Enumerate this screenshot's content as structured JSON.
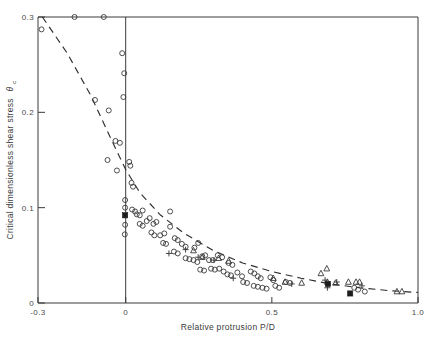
{
  "chart_data": {
    "type": "scatter",
    "title": "",
    "xlabel": "Relative protrusion P/D",
    "ylabel": "Critical dimensionless shear stress θc",
    "ylabel_main": "Critical dimensionless shear stress",
    "ylabel_symbol": "θ",
    "ylabel_subscript": "c",
    "xlim": [
      -0.3,
      1.0
    ],
    "ylim": [
      0.0,
      0.3
    ],
    "xticks": [
      -0.3,
      0,
      0.5,
      1.0
    ],
    "xticklabels": [
      "-0.3",
      "0",
      "0.5",
      "1.0"
    ],
    "yticks": [
      0,
      0.1,
      0.2,
      0.3
    ],
    "yticklabels": [
      "0",
      "0.1",
      "0.2",
      "0.3"
    ],
    "grid": false,
    "legend": "none",
    "marker_colors": {
      "open_circle": "#3a3a3a",
      "open_triangle": "#3a3a3a",
      "filled_square": "#1d1d1d",
      "plus": "#3a3a3a",
      "trendline": "#2e2e2e",
      "axis": "#3b3b3b"
    },
    "annotations": [
      {
        "name": "vertical-reference-line",
        "x": 0.0,
        "note": "vertical line at P/D = 0"
      },
      {
        "name": "dashed-trend-curve",
        "note": "dashed decreasing trend from upper-left to lower-right"
      }
    ],
    "trendline": {
      "style": "dashed",
      "points": [
        [
          -0.285,
          0.3
        ],
        [
          -0.2,
          0.262
        ],
        [
          -0.12,
          0.218
        ],
        [
          -0.05,
          0.172
        ],
        [
          0.0,
          0.14
        ],
        [
          0.05,
          0.115
        ],
        [
          0.12,
          0.092
        ],
        [
          0.2,
          0.073
        ],
        [
          0.3,
          0.055
        ],
        [
          0.4,
          0.042
        ],
        [
          0.5,
          0.033
        ],
        [
          0.6,
          0.026
        ],
        [
          0.7,
          0.02
        ],
        [
          0.8,
          0.016
        ],
        [
          0.9,
          0.013
        ],
        [
          1.0,
          0.011
        ]
      ]
    },
    "series": [
      {
        "name": "Open circles",
        "marker": "open_circle",
        "points": [
          [
            -0.288,
            0.287
          ],
          [
            -0.175,
            0.3
          ],
          [
            -0.075,
            0.3
          ],
          [
            -0.105,
            0.213
          ],
          [
            -0.058,
            0.202
          ],
          [
            -0.035,
            0.17
          ],
          [
            -0.062,
            0.15
          ],
          [
            -0.03,
            0.139
          ],
          [
            -0.012,
            0.262
          ],
          [
            -0.005,
            0.241
          ],
          [
            -0.008,
            0.216
          ],
          [
            -0.02,
            0.168
          ],
          [
            0.012,
            0.148
          ],
          [
            0.016,
            0.144
          ],
          [
            0.02,
            0.126
          ],
          [
            0.025,
            0.122
          ],
          [
            -0.002,
            0.108
          ],
          [
            -0.002,
            0.1
          ],
          [
            -0.002,
            0.082
          ],
          [
            -0.003,
            0.072
          ],
          [
            0.022,
            0.098
          ],
          [
            0.032,
            0.096
          ],
          [
            0.038,
            0.093
          ],
          [
            0.048,
            0.092
          ],
          [
            0.058,
            0.097
          ],
          [
            0.048,
            0.083
          ],
          [
            0.058,
            0.081
          ],
          [
            0.072,
            0.086
          ],
          [
            0.082,
            0.089
          ],
          [
            0.095,
            0.083
          ],
          [
            0.105,
            0.085
          ],
          [
            0.088,
            0.074
          ],
          [
            0.098,
            0.071
          ],
          [
            0.118,
            0.071
          ],
          [
            0.132,
            0.073
          ],
          [
            0.128,
            0.063
          ],
          [
            0.138,
            0.062
          ],
          [
            0.152,
            0.096
          ],
          [
            0.152,
            0.08
          ],
          [
            0.168,
            0.068
          ],
          [
            0.178,
            0.066
          ],
          [
            0.192,
            0.062
          ],
          [
            0.205,
            0.059
          ],
          [
            0.165,
            0.054
          ],
          [
            0.178,
            0.052
          ],
          [
            0.205,
            0.047
          ],
          [
            0.218,
            0.046
          ],
          [
            0.235,
            0.058
          ],
          [
            0.248,
            0.063
          ],
          [
            0.232,
            0.045
          ],
          [
            0.245,
            0.043
          ],
          [
            0.262,
            0.049
          ],
          [
            0.272,
            0.05
          ],
          [
            0.285,
            0.045
          ],
          [
            0.298,
            0.045
          ],
          [
            0.255,
            0.035
          ],
          [
            0.268,
            0.034
          ],
          [
            0.292,
            0.036
          ],
          [
            0.305,
            0.035
          ],
          [
            0.315,
            0.05
          ],
          [
            0.33,
            0.048
          ],
          [
            0.32,
            0.036
          ],
          [
            0.335,
            0.033
          ],
          [
            0.352,
            0.042
          ],
          [
            0.365,
            0.04
          ],
          [
            0.348,
            0.03
          ],
          [
            0.36,
            0.029
          ],
          [
            0.382,
            0.032
          ],
          [
            0.398,
            0.028
          ],
          [
            0.402,
            0.022
          ],
          [
            0.415,
            0.021
          ],
          [
            0.428,
            0.033
          ],
          [
            0.44,
            0.031
          ],
          [
            0.452,
            0.028
          ],
          [
            0.462,
            0.026
          ],
          [
            0.438,
            0.018
          ],
          [
            0.452,
            0.017
          ],
          [
            0.468,
            0.016
          ],
          [
            0.482,
            0.015
          ],
          [
            0.495,
            0.027
          ],
          [
            0.505,
            0.024
          ],
          [
            0.512,
            0.018
          ],
          [
            0.525,
            0.016
          ],
          [
            0.548,
            0.022
          ],
          [
            0.562,
            0.021
          ],
          [
            0.782,
            0.016
          ],
          [
            0.795,
            0.014
          ],
          [
            0.818,
            0.012
          ]
        ]
      },
      {
        "name": "Open triangles",
        "marker": "open_triangle",
        "points": [
          [
            0.232,
            0.055
          ],
          [
            0.262,
            0.048
          ],
          [
            0.318,
            0.047
          ],
          [
            0.352,
            0.044
          ],
          [
            0.505,
            0.026
          ],
          [
            0.545,
            0.022
          ],
          [
            0.602,
            0.021
          ],
          [
            0.668,
            0.031
          ],
          [
            0.688,
            0.036
          ],
          [
            0.69,
            0.022
          ],
          [
            0.718,
            0.021
          ],
          [
            0.762,
            0.022
          ],
          [
            0.788,
            0.022
          ],
          [
            0.8,
            0.022
          ],
          [
            0.928,
            0.012
          ],
          [
            0.945,
            0.012
          ]
        ]
      },
      {
        "name": "Plus symbols",
        "marker": "plus",
        "points": [
          [
            0.148,
            0.052
          ],
          [
            0.205,
            0.056
          ],
          [
            0.248,
            0.048
          ],
          [
            0.302,
            0.045
          ],
          [
            0.368,
            0.026
          ],
          [
            0.568,
            0.02
          ],
          [
            0.682,
            0.024
          ],
          [
            0.69,
            0.016
          ],
          [
            0.722,
            0.022
          ],
          [
            0.808,
            0.018
          ]
        ]
      },
      {
        "name": "Filled squares",
        "marker": "filled_square",
        "points": [
          [
            -0.002,
            0.092
          ],
          [
            0.692,
            0.02
          ],
          [
            0.768,
            0.01
          ]
        ]
      }
    ]
  }
}
